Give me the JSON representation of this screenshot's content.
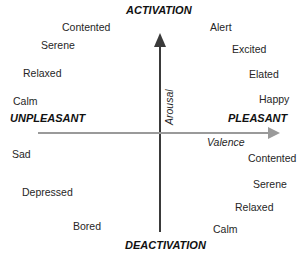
{
  "diagram": {
    "title_top": "ACTIVATION",
    "title_bottom": "DEACTIVATION",
    "pole_left": "UNPLEASANT",
    "pole_right": "PLEASANT",
    "axis_vertical_label": "Arousal",
    "axis_horizontal_label": "Valence",
    "colors": {
      "vertical_axis": "#3a3a3a",
      "horizontal_axis": "#9a9a9a",
      "text": "#262626",
      "background": "#ffffff"
    },
    "quadrants": {
      "upper_left": {
        "name": "unpleasant-activated",
        "words": [
          "Contented",
          "Serene",
          "Relaxed",
          "Calm"
        ]
      },
      "upper_right": {
        "name": "pleasant-activated",
        "words": [
          "Alert",
          "Excited",
          "Elated",
          "Happy"
        ]
      },
      "lower_left": {
        "name": "unpleasant-deactivated",
        "words": [
          "Sad",
          "Depressed",
          "Bored"
        ]
      },
      "lower_right": {
        "name": "pleasant-deactivated",
        "words": [
          "Contented",
          "Serene",
          "Relaxed",
          "Calm"
        ]
      }
    }
  }
}
